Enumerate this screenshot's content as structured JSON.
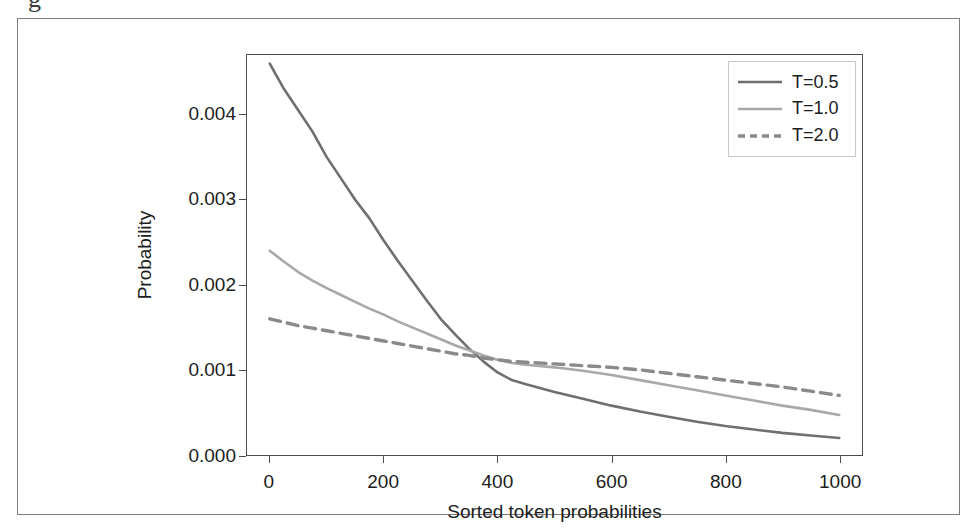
{
  "figure": {
    "background_color": "#ffffff",
    "frame_color": "#7e7e7e",
    "scan_artifact_glyph": "g"
  },
  "axes": {
    "axis_color": "#4d4d4d",
    "x_axis_title": "Sorted token probabilities",
    "y_axis_title": "Probability",
    "x_ticks": [
      "0",
      "200",
      "400",
      "600",
      "800",
      "1000"
    ],
    "y_ticks": [
      "0.000",
      "0.001",
      "0.002",
      "0.003",
      "0.004"
    ]
  },
  "legend": {
    "border_color": "#c9c9c9",
    "entries": [
      {
        "label": "T=0.5",
        "style": "solid",
        "color": "#6f6f6f"
      },
      {
        "label": "T=1.0",
        "style": "solid",
        "color": "#a8a8a8"
      },
      {
        "label": "T=2.0",
        "style": "dashed",
        "color": "#8a8a8a"
      }
    ]
  },
  "chart_data": {
    "type": "line",
    "title": "",
    "xlabel": "Sorted token probabilities",
    "ylabel": "Probability",
    "xlim": [
      -40,
      1040
    ],
    "ylim": [
      0.0,
      0.0047
    ],
    "grid": false,
    "legend_position": "upper right",
    "x": [
      0,
      25,
      50,
      75,
      100,
      125,
      150,
      175,
      200,
      225,
      250,
      275,
      300,
      325,
      350,
      375,
      400,
      425,
      450,
      500,
      550,
      600,
      650,
      700,
      750,
      800,
      850,
      900,
      950,
      1000
    ],
    "series": [
      {
        "name": "T=0.5",
        "color": "#6f6f6f",
        "style": "solid",
        "values": [
          0.0046,
          0.0043,
          0.00405,
          0.0038,
          0.0035,
          0.00325,
          0.003,
          0.00278,
          0.00252,
          0.00228,
          0.00205,
          0.00182,
          0.0016,
          0.00142,
          0.00125,
          0.0011,
          0.00097,
          0.00088,
          0.00083,
          0.00074,
          0.00066,
          0.00058,
          0.00051,
          0.00045,
          0.00039,
          0.00034,
          0.0003,
          0.00026,
          0.00023,
          0.0002
        ]
      },
      {
        "name": "T=1.0",
        "color": "#a8a8a8",
        "style": "solid",
        "values": [
          0.0024,
          0.00227,
          0.00215,
          0.00205,
          0.00196,
          0.00188,
          0.0018,
          0.00172,
          0.00165,
          0.00157,
          0.0015,
          0.00143,
          0.00136,
          0.00129,
          0.00123,
          0.00117,
          0.00112,
          0.00108,
          0.00106,
          0.00103,
          0.00099,
          0.00094,
          0.00088,
          0.00082,
          0.00076,
          0.0007,
          0.00064,
          0.00058,
          0.00053,
          0.00047
        ]
      },
      {
        "name": "T=2.0",
        "color": "#8a8a8a",
        "style": "dashed",
        "values": [
          0.0016,
          0.00156,
          0.00152,
          0.00149,
          0.00146,
          0.00143,
          0.0014,
          0.00137,
          0.00134,
          0.00131,
          0.00128,
          0.00125,
          0.00122,
          0.00119,
          0.00117,
          0.00114,
          0.00112,
          0.0011,
          0.00109,
          0.00107,
          0.00105,
          0.00103,
          0.001,
          0.00096,
          0.00092,
          0.00088,
          0.00084,
          0.0008,
          0.00075,
          0.0007
        ]
      }
    ]
  }
}
